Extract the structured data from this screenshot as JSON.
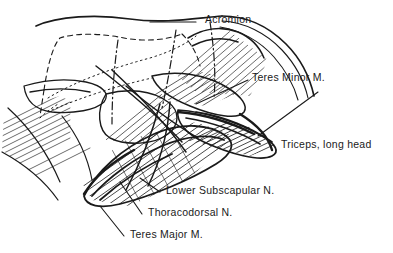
{
  "figure": {
    "background_color": "#ffffff",
    "ink_color": "#1a1a1a"
  },
  "labels": [
    {
      "id": "acromion",
      "text": "Acromion",
      "x": 205,
      "y": 18
    },
    {
      "id": "teres-minor",
      "text": "Teres Minor M.",
      "x": 252,
      "y": 76
    },
    {
      "id": "triceps-long-head",
      "text": "Triceps, long head",
      "x": 281,
      "y": 143
    },
    {
      "id": "lower-subscapular-n",
      "text": "Lower Subscapular N.",
      "x": 166,
      "y": 189
    },
    {
      "id": "thoracodorsal-n",
      "text": "Thoracodorsal N.",
      "x": 148,
      "y": 211
    },
    {
      "id": "teres-major",
      "text": "Teres Major M.",
      "x": 130,
      "y": 233
    }
  ]
}
